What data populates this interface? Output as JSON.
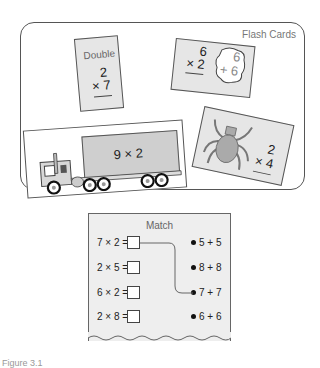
{
  "flash_cards_panel": {
    "title": "Flash Cards",
    "cards": [
      {
        "type": "double",
        "label": "Double",
        "top": "2",
        "bottom": "× 7"
      },
      {
        "type": "doubles-fact",
        "left_top": "6",
        "left_bottom": "× 2",
        "bubble_top": "6",
        "bubble_bottom": "+ 6"
      },
      {
        "type": "truck",
        "expression": "9 × 2"
      },
      {
        "type": "spider",
        "top": "2",
        "bottom": "× 4"
      }
    ]
  },
  "match_worksheet": {
    "title": "Match",
    "left_items": [
      "7 × 2 =",
      "2 × 5 =",
      "6 × 2 =",
      "2 × 8 ="
    ],
    "right_items": [
      "5 + 5",
      "8 + 8",
      "7 + 7",
      "6 + 6"
    ],
    "connection": {
      "from": "7 × 2 =",
      "to": "7 + 7"
    }
  },
  "caption": "Figure 3.1"
}
